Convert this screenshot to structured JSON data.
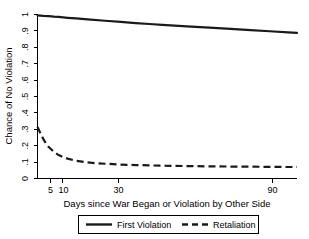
{
  "chart_data": {
    "type": "line",
    "title": "",
    "xlabel": "Days since War Began or Violation by Other Side",
    "ylabel": "Chance of No Violation",
    "xticks": [
      5,
      10,
      30,
      90
    ],
    "xticklabels": [
      "5",
      "10",
      "30",
      "90"
    ],
    "yticks": [
      0,
      0.1,
      0.2,
      0.3,
      0.4,
      0.5,
      0.6,
      0.7,
      0.8,
      0.9,
      1
    ],
    "yticklabels": [
      "0",
      ".1",
      ".2",
      ".3",
      ".4",
      ".5",
      ".6",
      ".7",
      ".8",
      ".9",
      "1"
    ],
    "ylim": [
      0,
      1
    ],
    "xlim": [
      4,
      105
    ],
    "grid": false,
    "legend_position": "below-axis",
    "series": [
      {
        "name": "First Violation",
        "style": "solid",
        "color": "#1a1a1a",
        "x": [
          4,
          5,
          6,
          7,
          8,
          10,
          12,
          15,
          20,
          25,
          30,
          35,
          40,
          50,
          60,
          70,
          80,
          90,
          100,
          105
        ],
        "y": [
          0.995,
          0.992,
          0.99,
          0.987,
          0.985,
          0.98,
          0.976,
          0.97,
          0.962,
          0.955,
          0.948,
          0.942,
          0.937,
          0.928,
          0.92,
          0.912,
          0.905,
          0.898,
          0.891,
          0.888
        ]
      },
      {
        "name": "Retaliation",
        "style": "dashed",
        "color": "#1a1a1a",
        "x": [
          4,
          4.5,
          5,
          5.5,
          6,
          7,
          8,
          9,
          10,
          12,
          14,
          17,
          20,
          25,
          30,
          35,
          40,
          50,
          60,
          70,
          80,
          90,
          100,
          105
        ],
        "y": [
          0.315,
          0.275,
          0.24,
          0.213,
          0.192,
          0.162,
          0.143,
          0.13,
          0.121,
          0.108,
          0.101,
          0.094,
          0.09,
          0.085,
          0.082,
          0.08,
          0.078,
          0.076,
          0.074,
          0.073,
          0.072,
          0.071,
          0.07,
          0.07
        ]
      }
    ],
    "legend": [
      {
        "label": "First Violation",
        "style": "solid"
      },
      {
        "label": "Retaliation",
        "style": "dashed"
      }
    ]
  }
}
